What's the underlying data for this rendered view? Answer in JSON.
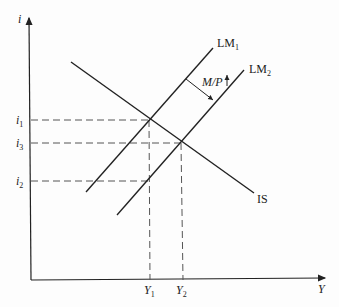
{
  "diagram": {
    "axes": {
      "y_label": "i",
      "x_label": "Y"
    },
    "curves": [
      {
        "id": "IS",
        "label": "IS"
      },
      {
        "id": "LM1",
        "label": "LM",
        "sub": "1"
      },
      {
        "id": "LM2",
        "label": "LM",
        "sub": "2"
      }
    ],
    "shift_annotation": {
      "text": "M/P",
      "arrow": "up-arrow"
    },
    "y_ticks": [
      {
        "label": "i",
        "sub": "1"
      },
      {
        "label": "i",
        "sub": "3"
      },
      {
        "label": "i",
        "sub": "2"
      }
    ],
    "x_ticks": [
      {
        "label": "Y",
        "sub": "1"
      },
      {
        "label": "Y",
        "sub": "2"
      }
    ],
    "colors": {
      "line": "#222222",
      "dash": "#555555"
    }
  }
}
